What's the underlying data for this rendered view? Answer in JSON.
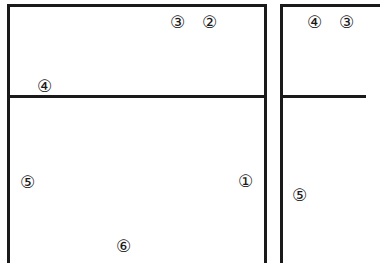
{
  "diagram": {
    "panels": [
      {
        "name": "left-panel",
        "upper_labels": [
          "③",
          "②",
          "④"
        ],
        "lower_labels": [
          "⑤",
          "①",
          "⑥"
        ]
      },
      {
        "name": "right-panel",
        "upper_labels": [
          "④",
          "③"
        ],
        "lower_labels": [
          "⑤"
        ]
      }
    ],
    "labels": {
      "left_top_3": "③",
      "left_top_2": "②",
      "left_top_4": "④",
      "left_bottom_5": "⑤",
      "left_bottom_1": "①",
      "left_bottom_6": "⑥",
      "right_top_4": "④",
      "right_top_3": "③",
      "right_bottom_5": "⑤"
    },
    "colors": {
      "line": "#1a1a1a",
      "background": "#ffffff"
    }
  }
}
